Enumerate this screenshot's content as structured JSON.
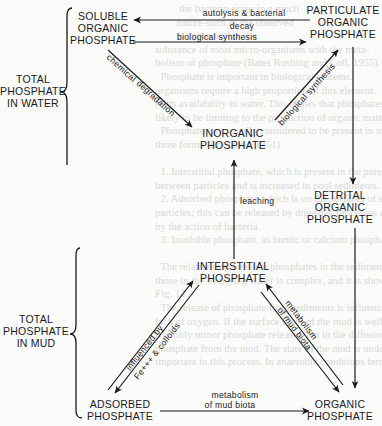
{
  "figure": {
    "type": "phosphate cycle diagram",
    "groups": {
      "water": {
        "line1": "TOTAL",
        "line2": "PHOSPHATE",
        "line3": "IN  WATER"
      },
      "mud": {
        "line1": "TOTAL",
        "line2": "PHOSPHATE",
        "line3": "IN  MUD"
      }
    },
    "nodes": {
      "soluble_organic": {
        "line1": "SOLUBLE",
        "line2": "ORGANIC",
        "line3": "PHOSPHATE"
      },
      "particulate_organic": {
        "line1": "PARTICULATE",
        "line2": "ORGANIC",
        "line3": "PHOSPHATE"
      },
      "inorganic": {
        "line1": "INORGANIC",
        "line2": "PHOSPHATE"
      },
      "detrital_organic": {
        "line1": "DETRITAL",
        "line2": "ORGANIC",
        "line3": "PHOSPHATE"
      },
      "interstitial": {
        "line1": "INTERSTITIAL",
        "line2": "PHOSPHATE"
      },
      "adsorbed": {
        "line1": "ADSORBED",
        "line2": "PHOSPHATE"
      },
      "organic": {
        "line1": "ORGANIC",
        "line2": "PHOSPHATE"
      }
    },
    "edges": {
      "autolysis": {
        "line1": "autolysis & bacterial",
        "line2": "decay",
        "from": "PARTICULATE ORGANIC PHOSPHATE",
        "to": "SOLUBLE ORGANIC PHOSPHATE"
      },
      "bio_synthesis_top": {
        "label": "biological synthesis",
        "from": "SOLUBLE ORGANIC PHOSPHATE",
        "to": "PARTICULATE ORGANIC PHOSPHATE"
      },
      "chemical_degradation": {
        "line1": "chemical",
        "line2": "degradation",
        "from": "SOLUBLE ORGANIC PHOSPHATE",
        "to": "INORGANIC PHOSPHATE"
      },
      "bio_synthesis_diag": {
        "label": "biological synthesis",
        "from": "INORGANIC PHOSPHATE",
        "to": "PARTICULATE ORGANIC PHOSPHATE"
      },
      "leaching": {
        "label": "leaching",
        "from": "INTERSTITIAL PHOSPHATE",
        "to": "INORGANIC PHOSPHATE"
      },
      "settling": {
        "from": "PARTICULATE ORGANIC PHOSPHATE",
        "to": "DETRITAL ORGANIC PHOSPHATE"
      },
      "detrital_to_organic": {
        "from": "DETRITAL ORGANIC PHOSPHATE",
        "to": "ORGANIC PHOSPHATE"
      },
      "adsorption": {
        "line1": "influenced  by",
        "line2": "Fe+++ & colloids",
        "between": [
          "ADSORBED PHOSPHATE",
          "INTERSTITIAL PHOSPHATE"
        ]
      },
      "mud_metabolism_diag": {
        "line1": "metabolism",
        "line2": "of  mud  biota",
        "between": [
          "INTERSTITIAL PHOSPHATE",
          "ORGANIC PHOSPHATE"
        ]
      },
      "mud_metabolism_bottom": {
        "line1": "metabolism",
        "line2": "of  mud  biota",
        "from": "ADSORBED PHOSPHATE",
        "to": "ORGANIC PHOSPHATE"
      }
    }
  },
  "colors": {
    "ink": "#1a1a1a",
    "paper": "#fbfbfa",
    "show_through": "#d9d9d6"
  },
  "ghost_text": "           the bacteria occur in a much\n          nature-such as the observed\n          to come-within the\n  substance of most micro-organisms with the meta-\n  bolism of phosphate (Bates Rushing and Coll, 1955).\n    Phosphate is important in biological systems.\n  organisms require a high proportion of this element.\n  to its availability in water. This shows that phosphates are\n  likely to be limiting to the production of organic matter.\n    Phosphates are usually considered to be present in mud in\n  three forms (Rochford, 1951)\n\n    1. Interstitial phosphate, which is present in the pore spaces\n  between particles and is increased in pool sediments.\n    2. Adsorbed phosphate, which is on the surfaces of silt\n  particles; this can be released by digestive processes and possibly\n  by the action of bacteria.\n    3. Insoluble phosphate, as humic or calcium phosphate.\n\n    The relationship between phosphates in the sediment\n  those in the overlying water is complex, and it is shown in\n  Fig. 14.\n    The release of phosphate from sediments is influenced by\n  lack of oxygen. If the surface layer of the mud is well oxygenated\n  it is only minor phosphate released but in the diffusion of\n  phosphate from the mud. The state of the mud is undoubtedly\n  important in this process. In anaerobic conditions ferrous iron"
}
